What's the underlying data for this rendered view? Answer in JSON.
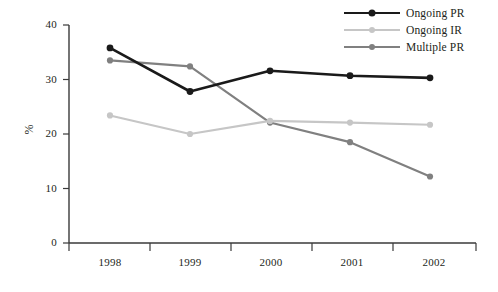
{
  "chart_data": {
    "type": "line",
    "title": "",
    "xlabel": "",
    "ylabel": "%",
    "categories": [
      "1998",
      "1999",
      "2000",
      "2001",
      "2002"
    ],
    "ylim": [
      0,
      40
    ],
    "xlim_categories": [
      "1998",
      "1999",
      "2000",
      "2001",
      "2002"
    ],
    "y_ticks": [
      "0",
      "10",
      "20",
      "30",
      "40"
    ],
    "y_tick_values": [
      0,
      10,
      20,
      30,
      40
    ],
    "grid": false,
    "legend_position": "top-right",
    "series": [
      {
        "name": "Ongoing PR",
        "color": "#1a1a1a",
        "marker": "circle",
        "values": [
          35.8,
          27.8,
          31.6,
          30.7,
          30.3
        ]
      },
      {
        "name": "Ongoing IR",
        "color": "#c6c6c6",
        "marker": "circle",
        "values": [
          23.4,
          20.0,
          22.4,
          22.1,
          21.7
        ]
      },
      {
        "name": "Multiple PR",
        "color": "#808080",
        "marker": "circle",
        "values": [
          33.5,
          32.4,
          22.1,
          18.5,
          12.2
        ]
      }
    ]
  },
  "axis": {
    "y_title": "%",
    "y_tick_labels": [
      "40",
      "30",
      "20",
      "10",
      "0"
    ],
    "x_tick_labels": [
      "1998",
      "1999",
      "2000",
      "2001",
      "2002"
    ]
  },
  "legend": {
    "items": [
      {
        "label": "Ongoing PR",
        "color": "#1a1a1a"
      },
      {
        "label": "Ongoing IR",
        "color": "#c6c6c6"
      },
      {
        "label": "Multiple PR",
        "color": "#808080"
      }
    ]
  },
  "colors": {
    "axis": "#3a3a3a",
    "text": "#231f20",
    "background": "#ffffff"
  }
}
